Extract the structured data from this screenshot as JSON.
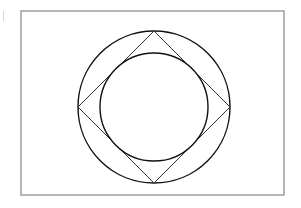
{
  "figure": {
    "frame": {
      "x": 21,
      "y": 11,
      "width": 263,
      "height": 184,
      "stroke": "#9e9e9e"
    },
    "outer_circle": {
      "cx": 154,
      "cy": 107,
      "r": 76,
      "stroke": "#111111"
    },
    "square": {
      "points": "154,31 230,107 154,183 78,107",
      "stroke": "#333333"
    },
    "inner_circle": {
      "cx": 154,
      "cy": 107,
      "r": 54,
      "stroke": "#111111"
    }
  }
}
